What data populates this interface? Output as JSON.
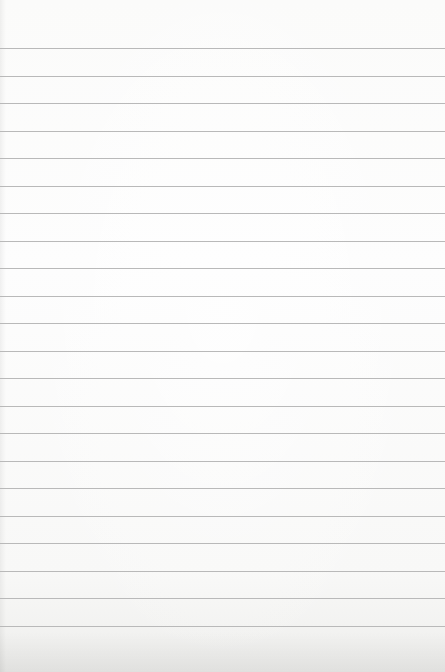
{
  "image": {
    "subject": "blank lined paper",
    "background_color": "#fbfbfa",
    "rule_color": "#b9b9b9",
    "rule_count": 22,
    "rule_first_y": 48,
    "rule_spacing": 27.5
  },
  "rules": [
    48,
    75.5,
    103,
    130.5,
    158,
    185.5,
    213,
    240.5,
    268,
    295.5,
    323,
    350.5,
    378,
    405.5,
    433,
    460.5,
    488,
    515.5,
    543,
    570.5,
    598,
    625.5
  ]
}
